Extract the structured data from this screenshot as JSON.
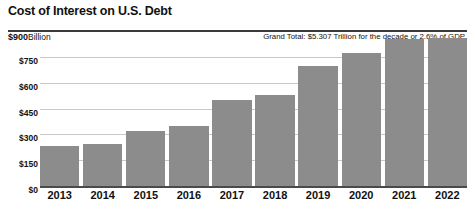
{
  "chart_data": {
    "type": "bar",
    "title": "Cost of Interest on U.S. Debt",
    "unit_prefix": "$900",
    "unit_label": "Billion",
    "annotation": "Grand Total: $5.307 Trillion for the decade or 2.6% of GDP",
    "xlabel": "",
    "ylabel": "Billion",
    "ylim": [
      0,
      900
    ],
    "yticks": [
      "$0",
      "$150",
      "$300",
      "$450",
      "$600",
      "$750",
      "$900"
    ],
    "ytick_values": [
      0,
      150,
      300,
      450,
      600,
      750,
      900
    ],
    "grid": true,
    "legend": "none",
    "bar_color": "#8c8c8c",
    "categories": [
      "2013",
      "2014",
      "2015",
      "2016",
      "2017",
      "2018",
      "2019",
      "2020",
      "2021",
      "2022"
    ],
    "values": [
      232,
      244,
      319,
      348,
      499,
      528,
      697,
      772,
      853,
      859
    ]
  }
}
